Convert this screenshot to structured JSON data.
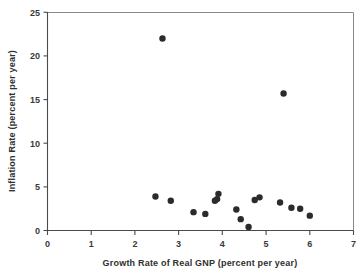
{
  "chart_data": {
    "type": "scatter",
    "title": "",
    "xlabel": "Growth Rate of Real GNP (percent per year)",
    "ylabel": "Inflation Rate (percent per year)",
    "xlim": [
      0,
      7
    ],
    "ylim": [
      0,
      25
    ],
    "xticks": [
      0,
      1,
      2,
      3,
      4,
      5,
      6,
      7
    ],
    "yticks": [
      0,
      5,
      10,
      15,
      20,
      25
    ],
    "xtick_labels": [
      "0",
      "1",
      "2",
      "3",
      "4",
      "5",
      "6",
      "7"
    ],
    "ytick_labels": [
      "0",
      "5",
      "10",
      "15",
      "20",
      "25"
    ],
    "grid": false,
    "legend": false,
    "marker": "filled-circle",
    "marker_color": "#2b2b2b",
    "marker_size": 3.2,
    "points": [
      {
        "x": 2.63,
        "y": 22.0
      },
      {
        "x": 5.4,
        "y": 15.7
      },
      {
        "x": 2.47,
        "y": 3.9
      },
      {
        "x": 2.82,
        "y": 3.4
      },
      {
        "x": 3.34,
        "y": 2.1
      },
      {
        "x": 3.61,
        "y": 1.9
      },
      {
        "x": 3.83,
        "y": 3.4
      },
      {
        "x": 3.88,
        "y": 3.6
      },
      {
        "x": 3.91,
        "y": 4.2
      },
      {
        "x": 4.32,
        "y": 2.4
      },
      {
        "x": 4.42,
        "y": 1.3
      },
      {
        "x": 4.6,
        "y": 0.4
      },
      {
        "x": 4.74,
        "y": 3.5
      },
      {
        "x": 4.85,
        "y": 3.8
      },
      {
        "x": 5.32,
        "y": 3.2
      },
      {
        "x": 5.58,
        "y": 2.6
      },
      {
        "x": 5.78,
        "y": 2.5
      },
      {
        "x": 6.0,
        "y": 1.7
      }
    ],
    "n_points": 18
  },
  "axes": {
    "x_axis_title": "Growth Rate of Real GNP (percent per year)",
    "y_axis_title": "Inflation Rate (percent per year)"
  }
}
